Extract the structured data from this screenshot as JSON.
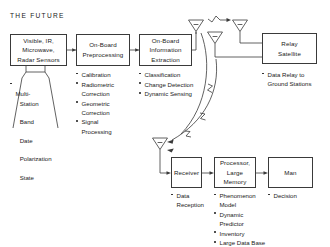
{
  "diagram": {
    "title": "THE  FUTURE",
    "accent_color": "#3a3a3a",
    "background": "#ffffff"
  },
  "nodes": {
    "sensors": {
      "label": "Visible, IR,\nMicrowave,\nRadar Sensors"
    },
    "preprocessing": {
      "label": "On-Board\nPreprocessing"
    },
    "extraction": {
      "label": "On-Board\nInformation\nExtraction"
    },
    "relay": {
      "label": "Relay\nSatellite"
    },
    "receiver": {
      "label": "Receiver"
    },
    "processor": {
      "label": "Processor,\nLarge\nMemory"
    },
    "man": {
      "label": "Man"
    }
  },
  "bullets": {
    "sensors": [
      {
        "text": "Multi-",
        "sub": [
          "Station",
          "Band",
          "Date",
          "Polarization",
          "State"
        ]
      }
    ],
    "preprocessing": [
      {
        "text": "Calibration"
      },
      {
        "text": "Radiometric\nCorrection"
      },
      {
        "text": "Geometric\nCorrection"
      },
      {
        "text": "Signal\nProcessing"
      }
    ],
    "extraction": [
      {
        "text": "Classification"
      },
      {
        "text": "Change Detection"
      },
      {
        "text": "Dynamic Sensing"
      }
    ],
    "relay": [
      {
        "text": "Data Relay to\nGround Stations"
      }
    ],
    "receiver": [
      {
        "text": "Data\nReception"
      }
    ],
    "processor": [
      {
        "text": "Phenomenon\nModel"
      },
      {
        "text": "Dynamic\nPredictor"
      },
      {
        "text": "Inventory"
      },
      {
        "text": "Large Data Base"
      }
    ],
    "man": [
      {
        "text": "Decision"
      }
    ]
  },
  "icons": {
    "antenna_sat_uplink": "antenna-icon",
    "antenna_relay": "antenna-icon",
    "antenna_downlink": "antenna-icon",
    "antenna_ground": "antenna-icon",
    "signal_arrow": "rf-signal-arrow-icon"
  }
}
